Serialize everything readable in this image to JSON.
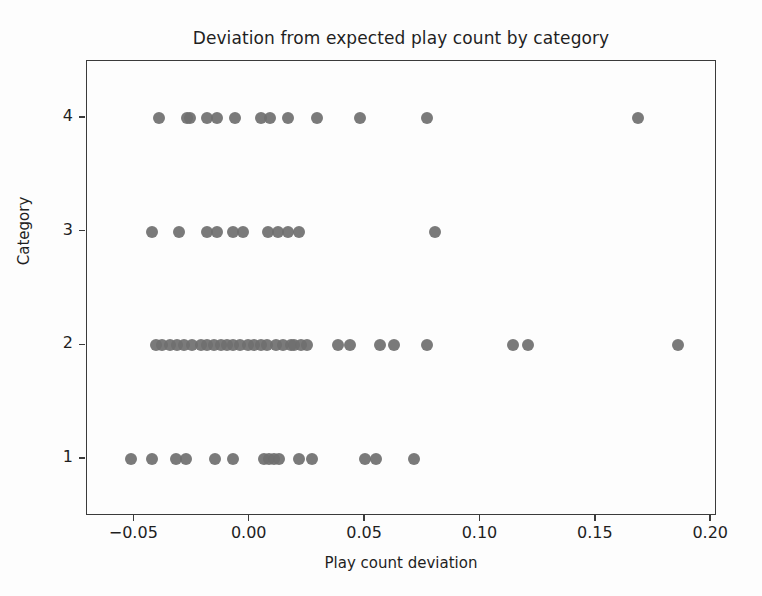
{
  "chart_data": {
    "type": "scatter",
    "title": "Deviation from expected play count by category",
    "xlabel": "Play count deviation",
    "ylabel": "Category",
    "xlim": [
      -0.0705,
      0.2025
    ],
    "ylim": [
      0.5,
      4.5
    ],
    "grid": false,
    "legend": null,
    "marker_color": "#6f6f6f",
    "marker_size": 12,
    "xticks": [
      -0.05,
      0.0,
      0.05,
      0.1,
      0.15,
      0.2
    ],
    "xtick_labels": [
      "−0.05",
      "0.00",
      "0.05",
      "0.10",
      "0.15",
      "0.20"
    ],
    "yticks": [
      1,
      2,
      3,
      4
    ],
    "ytick_labels": [
      "1",
      "2",
      "3",
      "4"
    ],
    "series": [
      {
        "name": "Category 4",
        "y": 4,
        "x": [
          -0.0394,
          -0.027,
          -0.0257,
          -0.0186,
          -0.0142,
          -0.0062,
          0.0049,
          0.0089,
          0.0168,
          0.0292,
          0.0478,
          0.077,
          0.1684
        ]
      },
      {
        "name": "Category 3",
        "y": 3,
        "x": [
          -0.0425,
          -0.0305,
          -0.0186,
          -0.0142,
          -0.0071,
          -0.0027,
          0.008,
          0.0124,
          0.0168,
          0.0212,
          0.0805
        ]
      },
      {
        "name": "Category 2",
        "y": 2,
        "x": [
          -0.0407,
          -0.0381,
          -0.0345,
          -0.0314,
          -0.0283,
          -0.0248,
          -0.0212,
          -0.0186,
          -0.0155,
          -0.0124,
          -0.0097,
          -0.0071,
          -0.004,
          -0.0009,
          0.0018,
          0.0049,
          0.0075,
          0.0115,
          0.0146,
          0.0177,
          0.0194,
          0.0221,
          0.0248,
          0.0381,
          0.0434,
          0.0566,
          0.0624,
          0.077,
          0.1142,
          0.1204,
          0.1854
        ]
      },
      {
        "name": "Category 1",
        "y": 1,
        "x": [
          -0.0513,
          -0.0425,
          -0.0319,
          -0.0274,
          -0.015,
          -0.0071,
          0.0062,
          0.0084,
          0.0106,
          0.0128,
          0.0212,
          0.027,
          0.05,
          0.0549,
          0.0712
        ]
      }
    ]
  }
}
